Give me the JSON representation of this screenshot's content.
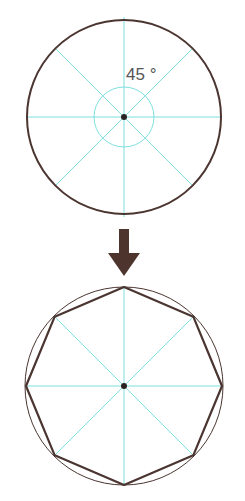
{
  "diagram": {
    "top": {
      "angle_label": "45 °",
      "division_count": 8,
      "angle_step_deg": 45
    },
    "arrow": {
      "direction": "down"
    },
    "bottom": {
      "shape": "octagon",
      "inscribed_in_circle": true
    },
    "colors": {
      "outline": "#4a3530",
      "guide": "#7fe0e0",
      "center": "#2a2222",
      "arrow": "#4d352d",
      "background": "#ffffff"
    }
  }
}
